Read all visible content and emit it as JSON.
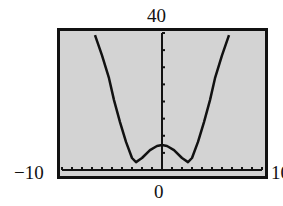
{
  "window_labels": {
    "ymax": "40",
    "ymin": "0",
    "xmin": "−10",
    "xmax": "10"
  },
  "colors": {
    "screen_background": "#d3d3d3",
    "frame": "#111111",
    "curve": "#111111",
    "axes": "#111111"
  },
  "chart_data": {
    "type": "line",
    "title": "",
    "xlabel": "",
    "ylabel": "",
    "xlim": [
      -10,
      10
    ],
    "ylim": [
      0,
      40
    ],
    "xtick_step": 1,
    "ytick_step": 5,
    "grid": false,
    "legend": null,
    "series": [
      {
        "name": "f(x)",
        "x": [
          -6.7,
          -6.0,
          -5.3,
          -4.8,
          -4.2,
          -3.6,
          -3.0,
          -2.6,
          -2.0,
          -1.2,
          -0.5,
          0,
          0.5,
          1.2,
          2.0,
          2.6,
          3.0,
          3.6,
          4.2,
          4.8,
          5.3,
          6.0,
          6.7
        ],
        "y": [
          39.4,
          33.5,
          26.8,
          20.4,
          14.0,
          8.2,
          3.5,
          2.3,
          3.5,
          5.8,
          7.0,
          7.3,
          7.0,
          5.8,
          3.5,
          2.3,
          3.5,
          8.2,
          14.0,
          20.4,
          26.8,
          33.5,
          39.4
        ]
      }
    ],
    "annotations": [
      "40",
      "0",
      "−10",
      "10"
    ]
  }
}
